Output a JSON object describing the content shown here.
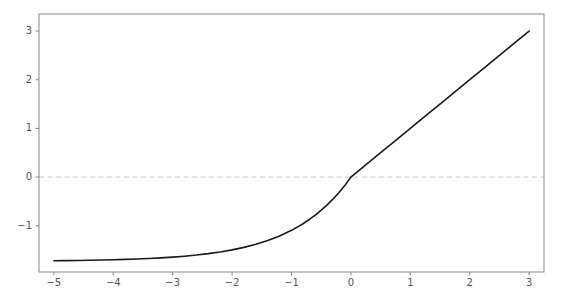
{
  "chart_data": {
    "type": "line",
    "title": "",
    "xlabel": "",
    "ylabel": "",
    "xlim": [
      -5.25,
      3.25
    ],
    "ylim": [
      -1.95,
      3.35
    ],
    "xticks": [
      -5,
      -4,
      -3,
      -2,
      -1,
      0,
      1,
      2,
      3
    ],
    "xticklabels": [
      "−5",
      "−4",
      "−3",
      "−2",
      "−1",
      "0",
      "1",
      "2",
      "3"
    ],
    "yticks": [
      -1,
      0,
      1,
      2,
      3
    ],
    "yticklabels": [
      "−1",
      "0",
      "1",
      "2",
      "3"
    ],
    "grid": false,
    "legend": null,
    "series": [
      {
        "name": "curve",
        "color": "#1a1a1a",
        "linewidth": 1.6,
        "linestyle": "solid",
        "x": [
          -5.0,
          -4.8,
          -4.6,
          -4.4,
          -4.2,
          -4.0,
          -3.8,
          -3.6,
          -3.4,
          -3.2,
          -3.0,
          -2.8,
          -2.6,
          -2.4,
          -2.2,
          -2.0,
          -1.8,
          -1.6,
          -1.4,
          -1.2,
          -1.0,
          -0.9,
          -0.8,
          -0.7,
          -0.6,
          -0.5,
          -0.4,
          -0.3,
          -0.2,
          -0.1,
          0.0,
          0.25,
          0.5,
          0.75,
          1.0,
          1.25,
          1.5,
          1.75,
          2.0,
          2.25,
          2.5,
          2.75,
          3.0
        ],
        "y": [
          -1.718,
          -1.716,
          -1.713,
          -1.709,
          -1.704,
          -1.698,
          -1.691,
          -1.683,
          -1.672,
          -1.659,
          -1.644,
          -1.625,
          -1.602,
          -1.573,
          -1.538,
          -1.496,
          -1.444,
          -1.38,
          -1.303,
          -1.209,
          -1.094,
          -1.027,
          -0.953,
          -0.871,
          -0.78,
          -0.68,
          -0.57,
          -0.449,
          -0.316,
          -0.17,
          0.0,
          0.25,
          0.5,
          0.75,
          1.0,
          1.25,
          1.5,
          1.75,
          2.0,
          2.25,
          2.5,
          2.75,
          3.0
        ]
      }
    ],
    "reference_lines": [
      {
        "name": "zero-line",
        "orientation": "horizontal",
        "value": 0,
        "color": "#c9c9c9",
        "linestyle": "dashed",
        "linewidth": 1.0
      }
    ],
    "axes": {
      "frame_color": "#888888",
      "frame_linewidth": 1.0,
      "tick_color": "#888888",
      "background": "#ffffff"
    }
  },
  "figure": {
    "background": "#ffffff",
    "width": 561,
    "height": 304
  }
}
